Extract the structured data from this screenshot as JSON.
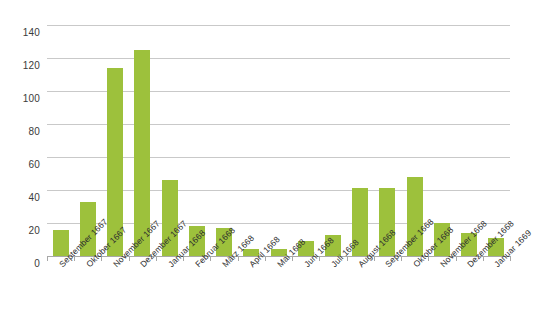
{
  "chart_data": {
    "type": "bar",
    "title": "",
    "subtitle": "",
    "xlabel": "",
    "ylabel": "",
    "ylim": [
      0,
      140
    ],
    "ytick_values": [
      0,
      20,
      40,
      60,
      80,
      100,
      120,
      140
    ],
    "ytick_labels": [
      "0",
      "20",
      "40",
      "60",
      "80",
      "100",
      "120",
      "140"
    ],
    "grid": true,
    "legend": false,
    "legend_position": "none",
    "bar_color": "#9dc13c",
    "gridline_color": "#c9c9c9",
    "axis_color": "#a8a8a8",
    "background_color": "#ffffff",
    "categories": [
      "September 1667",
      "Oktober 1667",
      "November 1667",
      "Dezember 1667",
      "Januar 1668",
      "Februar 1668",
      "März 1668",
      "April 1668",
      "Mai 1668",
      "Juni 1668",
      "Juli 1668",
      "August 1668",
      "September 1668",
      "Oktober 1668",
      "November 1668",
      "Dezember 1668",
      "Januar 1669"
    ],
    "values": [
      16,
      33,
      114,
      125,
      46,
      18,
      17,
      4,
      4,
      9,
      13,
      41,
      41,
      48,
      20,
      14,
      11
    ]
  }
}
